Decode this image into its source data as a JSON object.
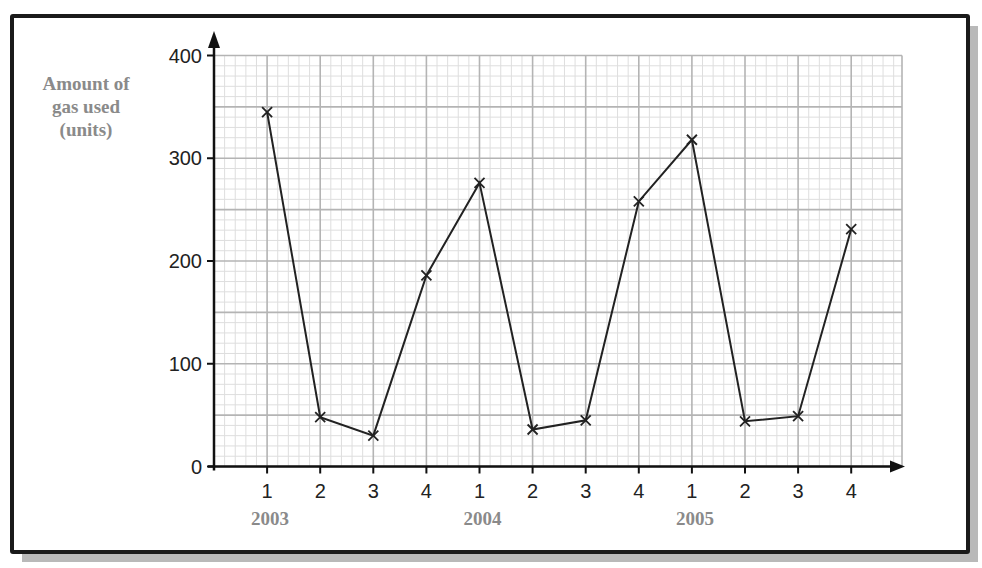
{
  "chart_data": {
    "type": "line",
    "title": "",
    "xlabel": "",
    "ylabel": "Amount of gas used (units)",
    "ylabel_lines": [
      "Amount of",
      "gas used",
      "(units)"
    ],
    "ylim": [
      0,
      400
    ],
    "yticks": [
      0,
      100,
      200,
      300,
      400
    ],
    "grid": true,
    "minor_grid_y_step": 10,
    "major_grid_y_step": 50,
    "categories": [
      "1",
      "2",
      "3",
      "4",
      "1",
      "2",
      "3",
      "4",
      "1",
      "2",
      "3",
      "4"
    ],
    "year_labels": [
      {
        "label": "2003",
        "at_index": 0
      },
      {
        "label": "2004",
        "at_index": 4
      },
      {
        "label": "2005",
        "at_index": 8
      }
    ],
    "series": [
      {
        "name": "Amount of gas used",
        "marker": "x",
        "values": [
          345,
          48,
          30,
          186,
          276,
          36,
          45,
          258,
          318,
          44,
          49,
          231
        ]
      }
    ]
  },
  "colors": {
    "line": "#222222",
    "axis": "#111111",
    "major_grid": "#b4b4b4",
    "minor_grid": "#dedede",
    "frame": "#1a1a1a",
    "shadow": "#b9b9b9",
    "label_gray": "#8a8a8a"
  }
}
